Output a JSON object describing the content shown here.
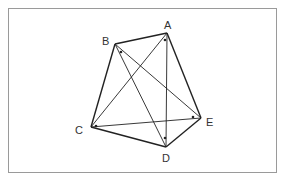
{
  "diagram": {
    "type": "geometry",
    "points": {
      "A": {
        "label": "A",
        "x": 167,
        "y": 33,
        "label_x": 164,
        "label_y": 29
      },
      "B": {
        "label": "B",
        "x": 115,
        "y": 44,
        "label_x": 102,
        "label_y": 45
      },
      "C": {
        "label": "C",
        "x": 91,
        "y": 127,
        "label_x": 75,
        "label_y": 134
      },
      "D": {
        "label": "D",
        "x": 166,
        "y": 147,
        "label_x": 162,
        "label_y": 162
      },
      "E": {
        "label": "E",
        "x": 201,
        "y": 118,
        "label_x": 206,
        "label_y": 126
      }
    },
    "sides": [
      [
        "A",
        "B"
      ],
      [
        "B",
        "C"
      ],
      [
        "C",
        "D"
      ],
      [
        "D",
        "E"
      ],
      [
        "E",
        "A"
      ]
    ],
    "diagonals": [
      [
        "A",
        "C"
      ],
      [
        "A",
        "D"
      ],
      [
        "B",
        "D"
      ],
      [
        "B",
        "E"
      ],
      [
        "C",
        "E"
      ]
    ],
    "angle_markers": [
      {
        "at": "A",
        "x": 165,
        "y": 40
      },
      {
        "at": "B",
        "x": 121,
        "y": 52
      },
      {
        "at": "C",
        "x": 96,
        "y": 126
      },
      {
        "at": "D",
        "x": 165,
        "y": 138
      },
      {
        "at": "E",
        "x": 193,
        "y": 117
      }
    ],
    "colors": {
      "line": "#222222",
      "label": "#333333",
      "frame": "#9a9a9a"
    }
  }
}
